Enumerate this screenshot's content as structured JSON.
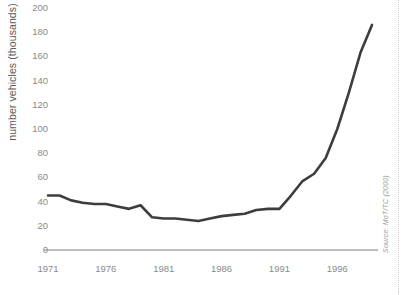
{
  "chart_data": {
    "type": "line",
    "title": "",
    "xlabel": "",
    "ylabel": "number vehicles (thousands)",
    "xlim": [
      1971,
      1999
    ],
    "ylim": [
      0,
      200
    ],
    "grid": false,
    "legend": null,
    "source_note": "Source: MoT/TC (2000)",
    "xticks": [
      "1971",
      "1976",
      "1981",
      "1986",
      "1991",
      "1996"
    ],
    "yticks": [
      "0",
      "20",
      "40",
      "60",
      "80",
      "100",
      "120",
      "140",
      "160",
      "180",
      "200"
    ],
    "series": [
      {
        "name": "number of vehicles",
        "color": "#3d3d3d",
        "x": [
          1971,
          1972,
          1973,
          1974,
          1975,
          1976,
          1977,
          1978,
          1979,
          1980,
          1981,
          1982,
          1983,
          1984,
          1985,
          1986,
          1987,
          1988,
          1989,
          1990,
          1991,
          1992,
          1993,
          1994,
          1995,
          1996,
          1997,
          1998,
          1999
        ],
        "values": [
          45,
          45,
          41,
          39,
          38,
          38,
          36,
          34,
          37,
          27,
          26,
          26,
          25,
          24,
          26,
          28,
          29,
          30,
          33,
          34,
          34,
          45,
          57,
          63,
          76,
          100,
          130,
          163,
          186
        ]
      }
    ]
  },
  "axis": {
    "baseline_color": "#a8a8a8",
    "tick_color": "#8a8a8a"
  }
}
